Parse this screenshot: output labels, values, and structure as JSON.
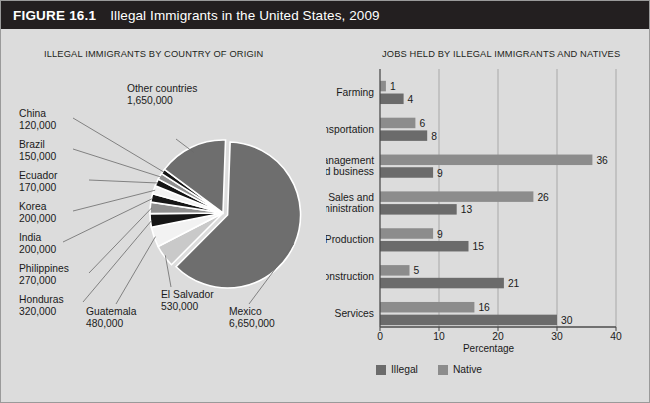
{
  "figure": {
    "number_label": "FIGURE 16.1",
    "title": "Illegal Immigrants in the United States, 2009",
    "title_bar_color": "#231f20",
    "background_color": "#dcdcdc"
  },
  "panels": {
    "left_heading": "ILLEGAL IMMIGRANTS BY COUNTRY OF ORIGIN",
    "right_heading": "JOBS HELD BY ILLEGAL IMMIGRANTS AND NATIVES"
  },
  "colors": {
    "dark_gray": "#6e6e6e",
    "mid_gray": "#8f8f8f",
    "light_gray": "#c9c9c9",
    "black": "#151515",
    "white": "#f2f2f2",
    "illegal": "#6b6b6b",
    "native": "#8c8c8c",
    "axis": "#4d4d4d",
    "grid": "#a8a8a8"
  },
  "chart_data": [
    {
      "type": "pie",
      "title": "ILLEGAL IMMIGRANTS BY COUNTRY OF ORIGIN",
      "unit": "people",
      "labels": [
        "Mexico",
        "Other countries",
        "El Salvador",
        "Guatemala",
        "Honduras",
        "Philippines",
        "India",
        "Korea",
        "Ecuador",
        "Brazil",
        "China"
      ],
      "values": [
        6650000,
        1650000,
        530000,
        480000,
        320000,
        270000,
        200000,
        200000,
        170000,
        150000,
        120000
      ],
      "value_labels": [
        "6,650,000",
        "1,650,000",
        "530,000",
        "480,000",
        "320,000",
        "270,000",
        "200,000",
        "200,000",
        "170,000",
        "150,000",
        "120,000"
      ],
      "slice_colors": [
        "#6e6e6e",
        "#6e6e6e",
        "#c9c9c9",
        "#f2f2f2",
        "#151515",
        "#8f8f8f",
        "#151515",
        "#f2f2f2",
        "#151515",
        "#8f8f8f",
        "#151515"
      ]
    },
    {
      "type": "bar",
      "orientation": "horizontal",
      "title": "JOBS HELD BY ILLEGAL IMMIGRANTS AND NATIVES",
      "xlabel": "Percentage",
      "ylabel": "",
      "xlim": [
        0,
        40
      ],
      "xticks": [
        0,
        10,
        20,
        30,
        40
      ],
      "xtick_labels": [
        "0",
        "10",
        "20",
        "30",
        "40"
      ],
      "grid": true,
      "legend_position": "bottom",
      "categories": [
        "Farming",
        "Transportation",
        "Management and business",
        "Sales and administration",
        "Production",
        "Construction",
        "Services"
      ],
      "category_label_lines": [
        [
          "Farming"
        ],
        [
          "Transportation"
        ],
        [
          "Management",
          "and business"
        ],
        [
          "Sales and",
          "administration"
        ],
        [
          "Production"
        ],
        [
          "Construction"
        ],
        [
          "Services"
        ]
      ],
      "series": [
        {
          "name": "Native",
          "color": "#8c8c8c",
          "values": [
            1,
            6,
            36,
            26,
            9,
            5,
            16
          ],
          "value_labels": [
            "1",
            "6",
            "36",
            "26",
            "9",
            "5",
            "16"
          ]
        },
        {
          "name": "Illegal",
          "color": "#6b6b6b",
          "values": [
            4,
            8,
            9,
            13,
            15,
            21,
            30
          ],
          "value_labels": [
            "4",
            "8",
            "9",
            "13",
            "15",
            "21",
            "30"
          ]
        }
      ],
      "legend": [
        {
          "name": "Illegal",
          "color": "#6b6b6b"
        },
        {
          "name": "Native",
          "color": "#8c8c8c"
        }
      ]
    }
  ]
}
